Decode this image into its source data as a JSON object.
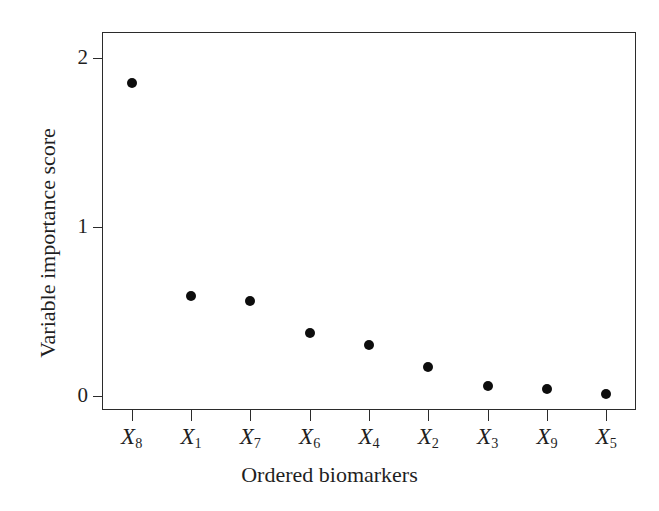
{
  "chart_data": {
    "type": "scatter",
    "title": "",
    "xlabel": "Ordered biomarkers",
    "ylabel": "Variable importance score",
    "categories": [
      "X8",
      "X1",
      "X7",
      "X6",
      "X4",
      "X2",
      "X3",
      "X9",
      "X5"
    ],
    "category_labels": [
      {
        "base": "X",
        "sub": "8"
      },
      {
        "base": "X",
        "sub": "1"
      },
      {
        "base": "X",
        "sub": "7"
      },
      {
        "base": "X",
        "sub": "6"
      },
      {
        "base": "X",
        "sub": "4"
      },
      {
        "base": "X",
        "sub": "2"
      },
      {
        "base": "X",
        "sub": "3"
      },
      {
        "base": "X",
        "sub": "9"
      },
      {
        "base": "X",
        "sub": "5"
      }
    ],
    "values": [
      1.85,
      0.59,
      0.56,
      0.37,
      0.3,
      0.17,
      0.06,
      0.04,
      0.01
    ],
    "ylim": [
      -0.085,
      2.155
    ],
    "ytick_values": [
      0,
      1,
      2
    ],
    "ytick_labels": [
      "0",
      "1",
      "2"
    ],
    "xlim": [
      0.5,
      9.5
    ],
    "grid": false,
    "legend": null,
    "marker": "filled-circle",
    "marker_color": "#0d0d0d",
    "frame_color": "#2b2b2b",
    "background_color": "#ffffff"
  }
}
